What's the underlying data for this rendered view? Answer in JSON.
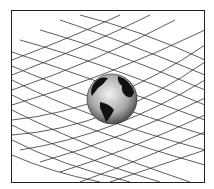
{
  "illustration": {
    "subject": "globe-on-curved-grid",
    "frame_color": "#222222",
    "grid_color": "#333333",
    "globe": {
      "cx": 112,
      "cy": 99,
      "r": 25,
      "ocean_color": "#b8b8b8",
      "land_color": "#111111"
    }
  }
}
